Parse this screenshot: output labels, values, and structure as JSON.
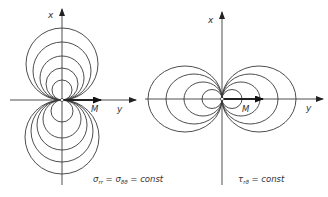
{
  "figure": {
    "left": {
      "axis_x_label": "x",
      "axis_y_label": "y",
      "moment_label": "M",
      "caption_sigma1": "σ",
      "caption_sub1": "rr",
      "caption_eq1": " = ",
      "caption_sigma2": "σ",
      "caption_sub2": "ϑϑ",
      "caption_rest": " = const",
      "circle_radii_top": [
        36,
        29,
        22,
        16,
        10
      ],
      "circle_radii_bottom": [
        37,
        31,
        25,
        19,
        11
      ],
      "orientation": "tangent circles above and below origin along x-axis"
    },
    "right": {
      "axis_x_label": "x",
      "axis_y_label": "y",
      "moment_label": "M",
      "caption_tau": "τ",
      "caption_sub": "rϑ",
      "caption_rest": " = const",
      "circle_radii": [
        37,
        28,
        19,
        10
      ],
      "orientation": "tangent circles left and right of origin along y-axis"
    }
  }
}
